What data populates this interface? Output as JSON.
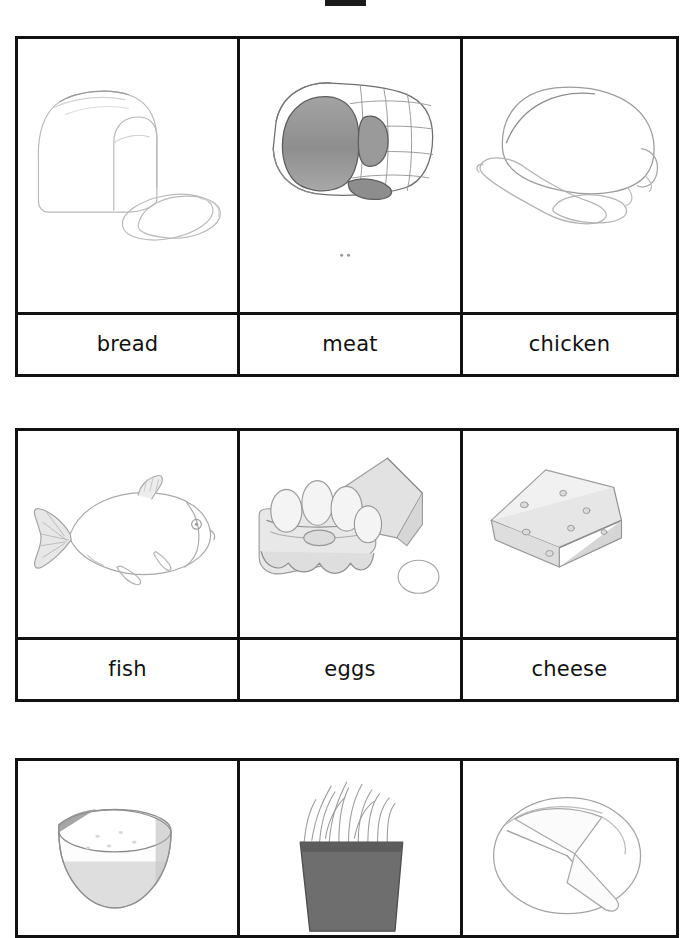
{
  "page": {
    "kind": "worksheet-scan",
    "width": 695,
    "height": 892,
    "background_color": "#ffffff",
    "ink_color": "#111111",
    "top_mark": "redaction-bar"
  },
  "rows": [
    {
      "index": 1,
      "cells": [
        {
          "label": "bread",
          "illustration": "bread-loaf-with-slices-drawing"
        },
        {
          "label": "meat",
          "illustration": "ham-roast-with-netting-drawing"
        },
        {
          "label": "chicken",
          "illustration": "whole-roast-chicken-drawing"
        }
      ]
    },
    {
      "index": 2,
      "cells": [
        {
          "label": "fish",
          "illustration": "whole-fish-drawing"
        },
        {
          "label": "eggs",
          "illustration": "open-egg-carton-with-eggs-drawing"
        },
        {
          "label": "cheese",
          "illustration": "cheese-wedge-with-holes-drawing"
        }
      ]
    },
    {
      "index": 3,
      "cut_off": true,
      "cells": [
        {
          "label": "",
          "illustration": "bowl-of-rice-drawing"
        },
        {
          "label": "",
          "illustration": "pot-of-noodles-drawing"
        },
        {
          "label": "",
          "illustration": "pie-with-slice-drawing"
        }
      ]
    }
  ]
}
